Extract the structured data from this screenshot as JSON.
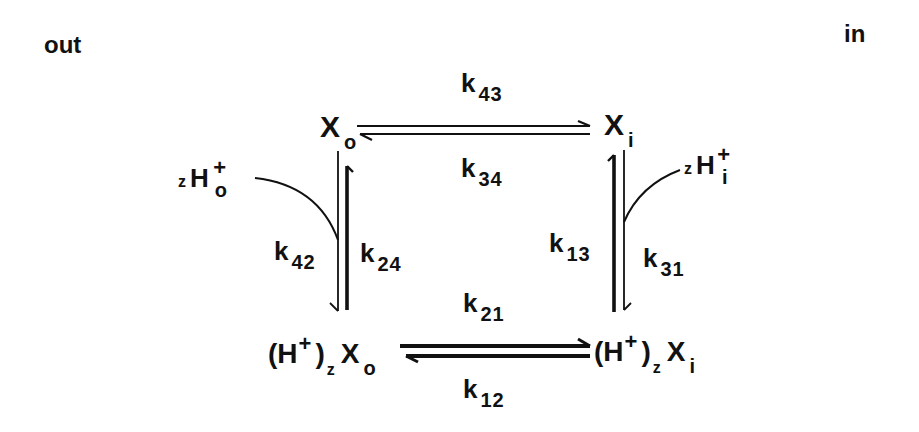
{
  "diagram": {
    "type": "reaction-scheme",
    "compartments": {
      "left": "out",
      "right": "in"
    },
    "species": {
      "Xo": {
        "main": "X",
        "sub": "o"
      },
      "Xi": {
        "main": "X",
        "sub": "i"
      },
      "HXo": {
        "open": "(H",
        "sup": "+",
        "close": ")",
        "zsub": "z",
        "main": "X",
        "sub": "o"
      },
      "HXi": {
        "open": "(H",
        "sup": "+",
        "close": ")",
        "zsub": "z",
        "main": "X",
        "sub": "i"
      }
    },
    "ions": {
      "Ho": {
        "coef": "z",
        "main": "H",
        "sup": "+",
        "sub": "o"
      },
      "Hi": {
        "coef": "z",
        "main": "H",
        "sup": "+",
        "sub": "i"
      }
    },
    "rate_constants": {
      "k43": {
        "k": "k",
        "idx": "43"
      },
      "k34": {
        "k": "k",
        "idx": "34"
      },
      "k42": {
        "k": "k",
        "idx": "42"
      },
      "k24": {
        "k": "k",
        "idx": "24"
      },
      "k13": {
        "k": "k",
        "idx": "13"
      },
      "k31": {
        "k": "k",
        "idx": "31"
      },
      "k21": {
        "k": "k",
        "idx": "21"
      },
      "k12": {
        "k": "k",
        "idx": "12"
      }
    },
    "edges": [
      {
        "from": "Xo",
        "to": "Xi",
        "forward": "k43",
        "reverse": "k34"
      },
      {
        "from": "Xo",
        "to": "HXo",
        "forward": "k42",
        "reverse": "k24",
        "cofactor": "Ho"
      },
      {
        "from": "Xi",
        "to": "HXi",
        "forward": "k31",
        "reverse": "k13",
        "cofactor": "Hi"
      },
      {
        "from": "HXo",
        "to": "HXi",
        "forward": "k21",
        "reverse": "k12"
      }
    ],
    "colors": {
      "ink": "#111111",
      "background": "#ffffff"
    }
  }
}
